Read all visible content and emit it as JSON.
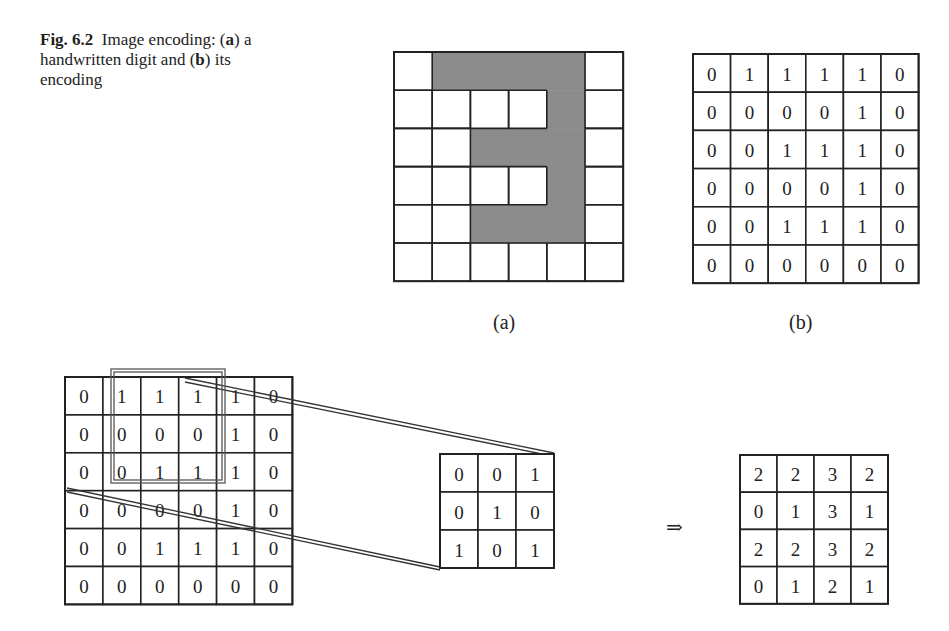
{
  "caption": {
    "label": "Fig. 6.2",
    "text_parts": [
      "Image encoding: (",
      "a",
      ") a handwritten digit and (",
      "b",
      ") its encoding"
    ]
  },
  "subfigures": {
    "a_label": "(a)",
    "b_label": "(b)"
  },
  "digit_image": {
    "description": "handwritten digit 3 on a 6x6 grid, shaded cells = 1",
    "shade_color": "#8c8c8c",
    "pixels": [
      [
        0,
        1,
        1,
        1,
        1,
        0
      ],
      [
        0,
        0,
        0,
        0,
        1,
        0
      ],
      [
        0,
        0,
        1,
        1,
        1,
        0
      ],
      [
        0,
        0,
        0,
        0,
        1,
        0
      ],
      [
        0,
        0,
        1,
        1,
        1,
        0
      ],
      [
        0,
        0,
        0,
        0,
        0,
        0
      ]
    ]
  },
  "encoding": [
    [
      0,
      1,
      1,
      1,
      1,
      0
    ],
    [
      0,
      0,
      0,
      0,
      1,
      0
    ],
    [
      0,
      0,
      1,
      1,
      1,
      0
    ],
    [
      0,
      0,
      0,
      0,
      1,
      0
    ],
    [
      0,
      0,
      1,
      1,
      1,
      0
    ],
    [
      0,
      0,
      0,
      0,
      0,
      0
    ]
  ],
  "convolution": {
    "input": [
      [
        0,
        1,
        1,
        1,
        1,
        0
      ],
      [
        0,
        0,
        0,
        0,
        1,
        0
      ],
      [
        0,
        0,
        1,
        1,
        1,
        0
      ],
      [
        0,
        0,
        0,
        0,
        1,
        0
      ],
      [
        0,
        0,
        1,
        1,
        1,
        0
      ],
      [
        0,
        0,
        0,
        0,
        0,
        0
      ]
    ],
    "window": {
      "row": 0,
      "col": 1,
      "size": 3
    },
    "kernel": [
      [
        0,
        0,
        1
      ],
      [
        0,
        1,
        0
      ],
      [
        1,
        0,
        1
      ]
    ],
    "arrow": "⇒",
    "output": [
      [
        2,
        2,
        3,
        2
      ],
      [
        0,
        1,
        3,
        1
      ],
      [
        2,
        2,
        3,
        2
      ],
      [
        0,
        1,
        2,
        1
      ]
    ]
  }
}
